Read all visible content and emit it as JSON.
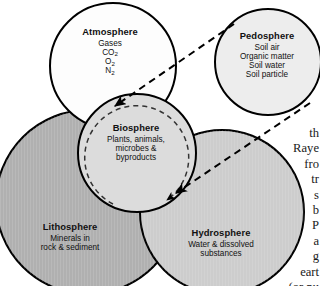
{
  "diagram": {
    "spheres": [
      {
        "key": "atmosphere",
        "name": "Atmosphere",
        "items": [
          "Gases",
          "CO2",
          "O2",
          "N2"
        ],
        "fill": "#fdfdfd"
      },
      {
        "key": "pedosphere",
        "name": "Pedosphere",
        "items": [
          "Soil air",
          "Organic matter",
          "Soil water",
          "Soil particle"
        ],
        "fill": "#ededed"
      },
      {
        "key": "biosphere",
        "name": "Biosphere",
        "items": [
          "Plants, animals,",
          "microbes &",
          "byproducts"
        ],
        "fill": "#dcdcdc"
      },
      {
        "key": "lithosphere",
        "name": "Lithosphere",
        "items": [
          "Minerals in",
          "rock & sediment"
        ],
        "fill": "#b0b0b0"
      },
      {
        "key": "hydrosphere",
        "name": "Hydrosphere",
        "items": [
          "Water & dissolved",
          "substances"
        ],
        "fill": "#cdcdcd"
      }
    ],
    "connectors": [
      {
        "name": "pedosphere-to-biosphere-upper",
        "style": "dashed-arrow"
      },
      {
        "name": "pedosphere-to-biosphere-lower",
        "style": "dashed-arrow"
      },
      {
        "name": "biosphere-cycle",
        "style": "dashed-circle-arrow"
      }
    ],
    "stroke": "#000000"
  },
  "body_text": {
    "lines": [
      "th",
      "Raye",
      "fro",
      "tr",
      "s",
      "b",
      "P",
      "a",
      "g",
      "eart",
      "(or nu"
    ]
  }
}
